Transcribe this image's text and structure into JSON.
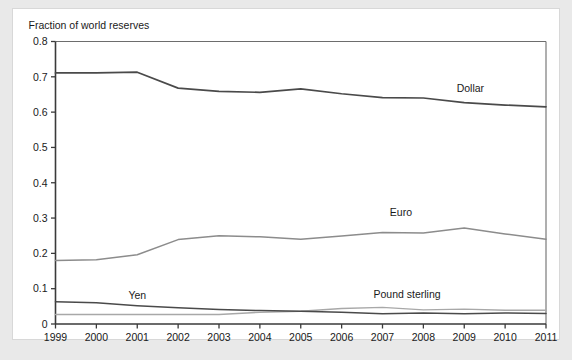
{
  "card": {
    "background_color": "#ffffff",
    "page_background_color": "#e9e9e9"
  },
  "chart_data": {
    "type": "line",
    "title": "Fraction of world reserves",
    "xlabel": "",
    "ylabel": "",
    "xlim": [
      1999,
      2011
    ],
    "ylim": [
      0,
      0.8
    ],
    "grid": false,
    "legend": "inline-annotations",
    "x": [
      1999,
      2000,
      2001,
      2002,
      2003,
      2004,
      2005,
      2006,
      2007,
      2008,
      2009,
      2010,
      2011
    ],
    "x_tick_labels": [
      "1999",
      "2000",
      "2001",
      "2002",
      "2003",
      "2004",
      "2005",
      "2006",
      "2007",
      "2008",
      "2009",
      "2010",
      "2011"
    ],
    "y_ticks": [
      0,
      0.1,
      0.2,
      0.3,
      0.4,
      0.5,
      0.6,
      0.7,
      0.8
    ],
    "y_tick_labels": [
      "0",
      "0.1",
      "0.2",
      "0.3",
      "0.4",
      "0.5",
      "0.6",
      "0.7",
      "0.8"
    ],
    "series": [
      {
        "name": "Dollar",
        "label": "Dollar",
        "color": "#4a4a4a",
        "width": 1.7,
        "values": [
          0.711,
          0.711,
          0.713,
          0.668,
          0.659,
          0.656,
          0.666,
          0.652,
          0.641,
          0.64,
          0.627,
          0.62,
          0.615
        ],
        "label_x": 2009.15,
        "label_y": 0.658
      },
      {
        "name": "Euro",
        "label": "Euro",
        "color": "#8c8c8c",
        "width": 1.5,
        "values": [
          0.18,
          0.182,
          0.196,
          0.239,
          0.25,
          0.247,
          0.24,
          0.249,
          0.259,
          0.258,
          0.272,
          0.255,
          0.24
        ],
        "label_x": 2007.45,
        "label_y": 0.305
      },
      {
        "name": "Yen",
        "label": "Yen",
        "color": "#4a4a4a",
        "width": 1.5,
        "values": [
          0.063,
          0.06,
          0.052,
          0.046,
          0.041,
          0.038,
          0.036,
          0.033,
          0.029,
          0.031,
          0.029,
          0.031,
          0.03
        ],
        "label_x": 2001.0,
        "label_y": 0.072
      },
      {
        "name": "Pound sterling",
        "label": "Pound sterling",
        "color": "#a8a8a8",
        "width": 1.4,
        "values": [
          0.027,
          0.027,
          0.027,
          0.027,
          0.027,
          0.033,
          0.036,
          0.044,
          0.047,
          0.04,
          0.042,
          0.039,
          0.039
        ],
        "label_x": 2007.6,
        "label_y": 0.073
      }
    ]
  }
}
